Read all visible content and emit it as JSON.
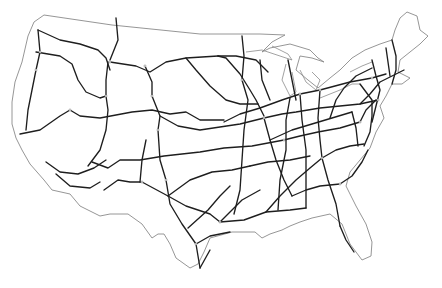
{
  "map": {
    "title": "",
    "description": "Outline map of the contiguous United States showing the Interstate highway network",
    "colors": {
      "background": "#ffffff",
      "border": "#8a8a8a",
      "highway": "#1e1e1e"
    },
    "labels": [],
    "border_paths": [
      "M44,15 L112,25 L200,34 L260,34 L285,35 L272,42 L262,52 L270,48 L290,44 L310,50 L318,58 L324,62 L312,58 L300,56 L296,70 L308,80 L318,88 L330,78 L340,70 L352,58 L365,50 L380,44 L392,40 L395,30 L400,18 L407,12 L417,16 L420,30 L428,36 L420,44 L410,52 L400,60 L398,72 L410,78 L402,84 L392,84 L386,96 L380,106 L384,118 L376,132 L370,148 L360,160 L350,172 L346,186 L356,206 L366,224 L372,242 L371,256 L362,260 L350,244 L342,224 L330,214 L312,218 L300,222 L290,226 L282,230 L270,234 L262,238 L255,232 L232,232 L210,238 L204,252 L198,264 L190,268 L176,258 L170,244 L164,234 L158,234 L152,238 L142,224 L128,214 L110,214 L100,216 L80,206 L70,194 L52,190 L44,180 L30,164 L22,150 L16,138 L12,124 L12,102 L15,82 L22,62 L28,36 L34,22 Z"
    ],
    "lake_paths": [
      "M246,52 L262,50 L280,56 L292,60 L288,54 L272,46",
      "M286,64 L282,80 L290,96 L296,92 L292,72",
      "M300,70 L306,82 L316,90 L320,80 L312,72",
      "M320,98 L340,90 L352,84 L360,84",
      "M350,72 L362,66 L372,62"
    ],
    "highway_paths": [
      "M38,30 L40,52 L36,70 L32,90 L28,110 L26,130",
      "M38,30 L60,40 L80,44 L98,50 L106,58 L110,70",
      "M36,52 L60,56 L72,64 L78,80 L86,92 L100,98 L106,96",
      "M108,62 L106,80 L106,96 L108,110 L106,130 L100,150 L88,166",
      "M116,18 L118,40 L110,60",
      "M110,62 L136,66 L150,72 L166,62 L186,58 L218,56",
      "M145,66 L152,82 L152,96 L160,116 L158,130",
      "M20,134 L40,130 L60,116 L70,110 L80,116 L100,118 L132,112 L152,110 L170,114 L186,112 L200,120 L224,120",
      "M160,116 L178,126 L200,130 L240,124 L264,118",
      "M158,130 L160,160 L166,180 L170,204 L182,224 L196,244 L200,268",
      "M46,162 L60,172 L78,174 L94,168 L106,160",
      "M56,174 L70,186 L90,188 L100,182",
      "M92,162 L108,168 L120,160 L140,160 L164,156 L200,152 L224,148 L252,146 L284,140",
      "M104,190 L118,180 L130,182 L142,182",
      "M140,182 L142,160 L146,140",
      "M142,182 L168,196 L186,206 L210,214 L220,222",
      "M168,196 L190,180 L212,172 L232,170 L250,166",
      "M188,228 L208,210 L220,196 L230,186",
      "M220,222 L230,212 L242,200 L260,190",
      "M220,222 L244,220 L266,212 L290,210 L306,208",
      "M196,244 L210,236 L230,232",
      "M200,268 L210,250",
      "M218,56 L226,58 L240,74 L250,90 L256,100 L264,116",
      "M186,58 L196,70 L210,86 L226,100 L240,104 L258,104",
      "M218,56 L236,56 L256,60 L268,72",
      "M264,118 L270,140 L276,160 L284,180 L292,196",
      "M242,36 L244,56 L242,80 L248,100 L244,130 L242,160 L240,190 L234,214",
      "M224,122 L240,114 L260,108 L282,100 L300,94 L320,90 L350,82 L372,78 L386,74",
      "M264,118 L282,114 L296,112 L320,108 L340,106 L360,104 L378,100",
      "M270,140 L292,130 L312,124 L332,118 L352,112",
      "M284,140 L300,136 L318,132 L340,128 L360,122",
      "M266,212 L280,196 L296,180 L310,168 L322,158",
      "M250,166 L268,162 L290,160 L310,156",
      "M292,196 L306,190 L320,186 L340,184",
      "M290,98 L286,120 L286,150 L280,180 L278,210",
      "M300,94 L302,120 L306,150 L306,180 L306,208",
      "M320,90 L318,118 L320,140 L322,158 L328,180 L336,204 L340,226",
      "M322,158 L336,150 L350,146 L364,144",
      "M340,184 L352,176 L362,162 L368,150",
      "M288,60 L292,80 L296,100",
      "M260,60 L262,80 L270,100",
      "M340,226 L346,240 L354,252",
      "M352,112 L356,128 L358,146",
      "M330,118 L336,100 L344,88 L356,76 L372,68",
      "M372,60 L376,76 L380,90 L376,106 L372,122",
      "M386,48 L388,62 L390,76",
      "M392,40 L396,56 L396,70 L392,84",
      "M360,104 L370,94 L380,82 L392,76 L404,70",
      "M360,122 L366,110 L376,100",
      "M360,84 L366,92 L372,100 L372,116 L370,132 L364,146"
    ],
    "node_points": [
      [
        40,
        52
      ],
      [
        36,
        70
      ],
      [
        106,
        96
      ],
      [
        110,
        62
      ],
      [
        145,
        66
      ],
      [
        152,
        96
      ],
      [
        158,
        130
      ],
      [
        142,
        182
      ],
      [
        166,
        180
      ],
      [
        220,
        222
      ],
      [
        242,
        80
      ],
      [
        264,
        118
      ],
      [
        284,
        140
      ],
      [
        300,
        94
      ],
      [
        320,
        90
      ],
      [
        322,
        158
      ],
      [
        340,
        184
      ],
      [
        372,
        78
      ],
      [
        378,
        100
      ],
      [
        360,
        122
      ],
      [
        196,
        244
      ],
      [
        70,
        110
      ]
    ]
  }
}
